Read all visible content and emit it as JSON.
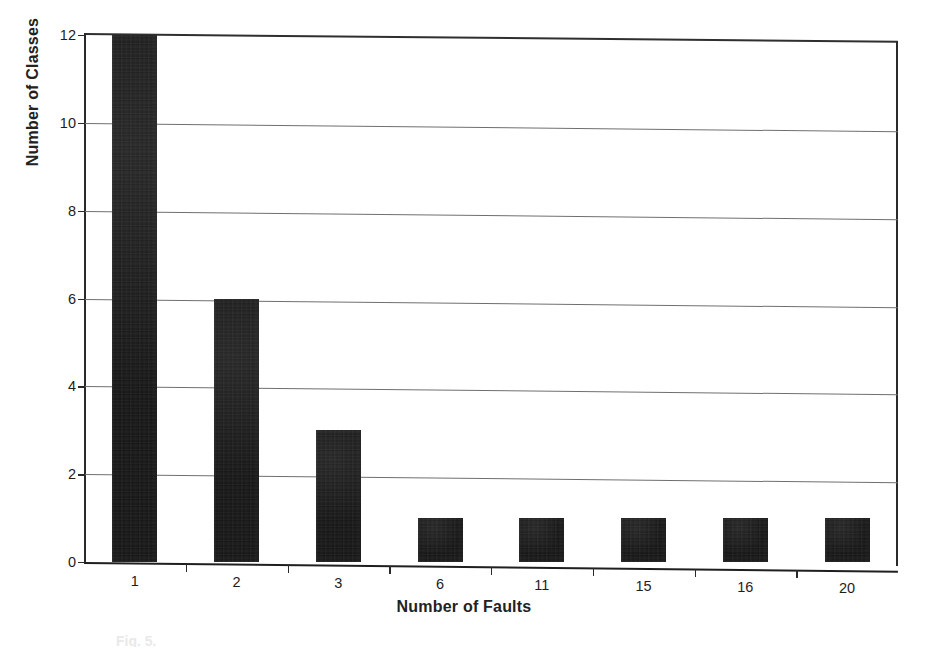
{
  "chart_data": {
    "type": "bar",
    "title": "",
    "xlabel": "Number of Faults",
    "ylabel": "Number of Classes",
    "categories": [
      "1",
      "2",
      "3",
      "6",
      "11",
      "15",
      "16",
      "20"
    ],
    "values": [
      12,
      6,
      3,
      1,
      1,
      1,
      1,
      1
    ],
    "ylim": [
      0,
      12
    ],
    "yticks": [
      0,
      2,
      4,
      6,
      8,
      10,
      12
    ],
    "ytick_labels": [
      "0",
      "2",
      "4",
      "6",
      "8",
      "10",
      "12"
    ],
    "grid": "horizontal",
    "legend": "none",
    "bar_color": "#141414",
    "gridline_color": "#6f6f6f",
    "axis_color": "#2a2a2a",
    "background": "#ffffff"
  },
  "axes": {
    "y_title": "Number of Classes",
    "x_title": "Number of Faults"
  },
  "caption": {
    "text": "Fig. 5."
  }
}
